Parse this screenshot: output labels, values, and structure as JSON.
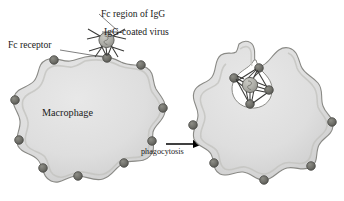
{
  "figure": {
    "background_color": "#ffffff",
    "labels": {
      "fc_region": "Fc region of IgG",
      "igg_coated_virus": "IgG-coated virus",
      "fc_receptor": "Fc receptor",
      "macrophage": "Macrophage",
      "phagocytosis": "phagocytosis"
    },
    "colors": {
      "cell_fill": "#dedede",
      "cell_fill_shade": "#cfcfcf",
      "cell_outline": "#8a8a86",
      "receptor_fill": "#6f6f69",
      "receptor_outline": "#4a4a46",
      "virus_fill": "#b0b0aa",
      "virus_outline": "#5a5a56",
      "antibody_stroke": "#3a3a38",
      "text": "#1a1a1a",
      "arrow": "#000000",
      "leader_line": "#555555"
    },
    "panels": [
      {
        "name": "before",
        "cell": "macrophage",
        "receptor_count": 10,
        "virus_bound": false,
        "virus_position": "outside-top"
      },
      {
        "name": "after",
        "cell": "macrophage",
        "receptor_count": 9,
        "virus_bound": true,
        "virus_position": "engulfed-in-phagocytic-cup"
      }
    ],
    "arrow": {
      "direction": "right",
      "label": "phagocytosis"
    }
  }
}
